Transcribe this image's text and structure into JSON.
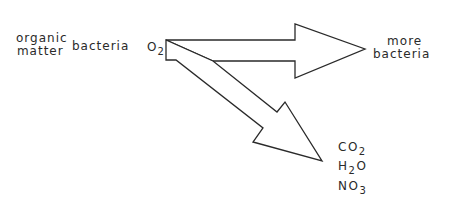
{
  "diagram": {
    "inputs": {
      "organic_matter": [
        "organic",
        "matter"
      ],
      "bacteria": "bacteria",
      "oxygen": {
        "base": "O",
        "sub": "2"
      }
    },
    "outputs": {
      "more_bacteria": [
        "more",
        "bacteria"
      ],
      "products": [
        {
          "pre": "CO",
          "sub": "2",
          "post": ""
        },
        {
          "pre": "H",
          "sub": "2",
          "post": "O"
        },
        {
          "pre": "NO",
          "sub": "3",
          "post": ""
        }
      ]
    },
    "colors": {
      "stroke": "#2a2a2a",
      "fill": "#ffffff"
    }
  }
}
